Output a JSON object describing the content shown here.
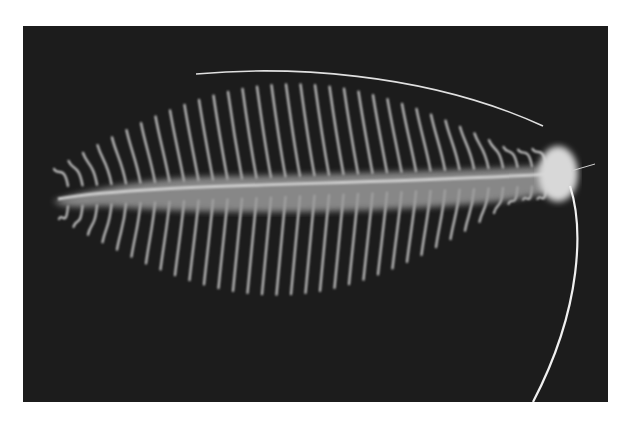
{
  "image": {
    "subject": "polychaete worm specimen on black background",
    "description": "Grayscale photograph of a segmented bristle worm with feathery parapodia along both sides and a long antenna/tentacle extending from the head",
    "colors": {
      "page_background": "#ffffff",
      "photo_background": "#1c1c1c",
      "specimen": "#e6e6e6"
    }
  }
}
